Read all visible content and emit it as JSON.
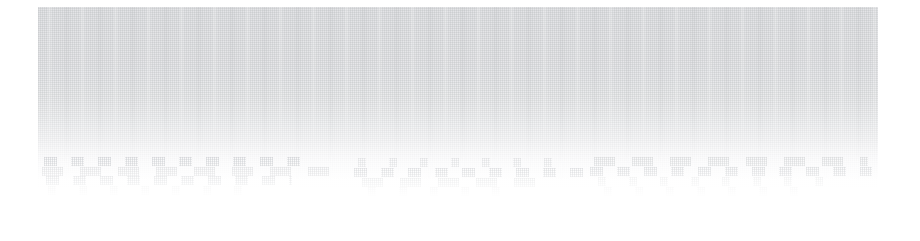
{
  "canvas": {
    "width": 920,
    "height": 241,
    "background_color": "#ffffff"
  },
  "panel": {
    "name": "faded-content-panel",
    "left": 38,
    "top": 7,
    "width": 840,
    "height": 190,
    "gradient_top_color": "#e3e4e6",
    "gradient_bottom_color": "#ffffff",
    "texture": "fine-dither-halftone",
    "legible_text": "",
    "note_visible_in_pixels": "no readable text, icons, numbers or controls are resolvable"
  },
  "ghost_text_rows": [
    {
      "left": 6,
      "top": 150,
      "width": 262,
      "density": "w-a"
    },
    {
      "left": 4,
      "top": 160,
      "width": 300,
      "density": "w-b"
    },
    {
      "left": 8,
      "top": 169,
      "width": 246,
      "density": "w-a"
    },
    {
      "left": 10,
      "top": 179,
      "width": 210,
      "density": "w-c"
    },
    {
      "left": 320,
      "top": 151,
      "width": 205,
      "density": "w-c"
    },
    {
      "left": 316,
      "top": 161,
      "width": 232,
      "density": "w-a"
    },
    {
      "left": 324,
      "top": 171,
      "width": 188,
      "density": "w-b"
    },
    {
      "left": 330,
      "top": 180,
      "width": 150,
      "density": "w-c"
    },
    {
      "left": 556,
      "top": 150,
      "width": 274,
      "density": "w-b"
    },
    {
      "left": 552,
      "top": 160,
      "width": 282,
      "density": "w-a"
    },
    {
      "left": 560,
      "top": 170,
      "width": 240,
      "density": "w-c"
    },
    {
      "left": 566,
      "top": 180,
      "width": 198,
      "density": "w-c"
    }
  ]
}
